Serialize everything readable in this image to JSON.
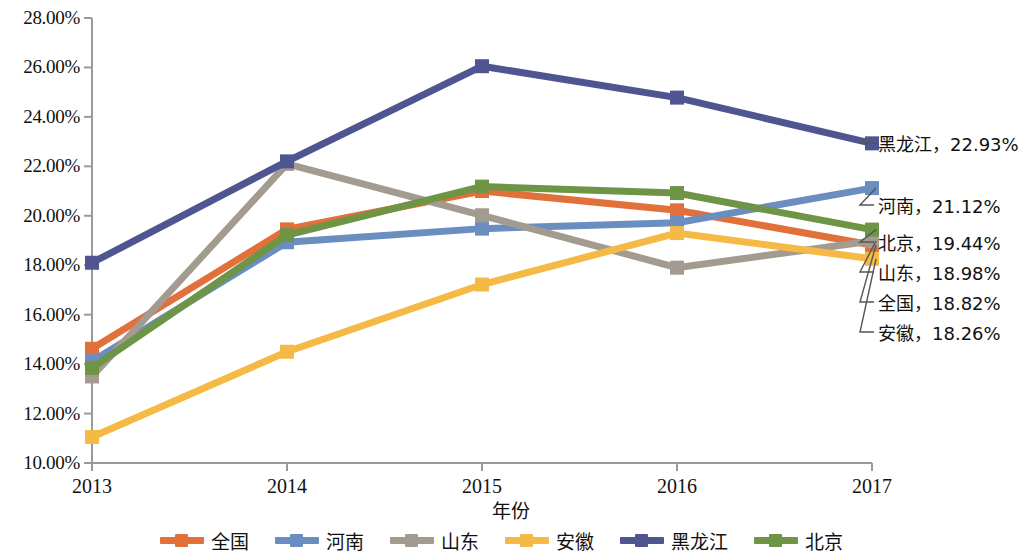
{
  "chart_data": {
    "type": "line",
    "title": "",
    "xlabel": "年份",
    "ylabel": "",
    "x": [
      "2013",
      "2014",
      "2015",
      "2016",
      "2017"
    ],
    "categories": [
      "2013",
      "2014",
      "2015",
      "2016",
      "2017"
    ],
    "ylim": [
      10,
      28
    ],
    "ytick_labels": [
      "10.00%",
      "12.00%",
      "14.00%",
      "16.00%",
      "18.00%",
      "20.00%",
      "22.00%",
      "24.00%",
      "26.00%",
      "28.00%"
    ],
    "ytick_values": [
      10,
      12,
      14,
      16,
      18,
      20,
      22,
      24,
      26,
      28
    ],
    "grid": false,
    "legend_position": "bottom",
    "series": [
      {
        "name": "全国",
        "color": "#E2703A",
        "values": [
          14.62,
          19.45,
          21.0,
          20.22,
          18.82
        ]
      },
      {
        "name": "河南",
        "color": "#6A8EBF",
        "values": [
          14.12,
          18.93,
          19.48,
          19.72,
          21.12
        ]
      },
      {
        "name": "山东",
        "color": "#A39A90",
        "values": [
          13.5,
          22.1,
          20.02,
          17.9,
          18.98
        ]
      },
      {
        "name": "安徽",
        "color": "#F5B945",
        "values": [
          11.05,
          14.5,
          17.22,
          19.3,
          18.26
        ]
      },
      {
        "name": "黑龙江",
        "color": "#4F5590",
        "values": [
          18.1,
          22.2,
          26.05,
          24.78,
          22.93
        ]
      },
      {
        "name": "北京",
        "color": "#6E9445",
        "values": [
          13.85,
          19.22,
          21.18,
          20.92,
          19.44
        ]
      }
    ],
    "end_labels": [
      {
        "name": "黑龙江",
        "value": "22.93%",
        "text": "黑龙江，22.93%",
        "color": "#4F5590"
      },
      {
        "name": "河南",
        "value": "21.12%",
        "text": "河南，21.12%",
        "color": "#6A8EBF"
      },
      {
        "name": "北京",
        "value": "19.44%",
        "text": "北京，19.44%",
        "color": "#6E9445"
      },
      {
        "name": "山东",
        "value": "18.98%",
        "text": "山东，18.98%",
        "color": "#A39A90"
      },
      {
        "name": "全国",
        "value": "18.82%",
        "text": "全国，18.82%",
        "color": "#E2703A"
      },
      {
        "name": "安徽",
        "value": "18.26%",
        "text": "安徽，18.26%",
        "color": "#F5B945"
      }
    ],
    "legend": [
      "全国",
      "河南",
      "山东",
      "安徽",
      "黑龙江",
      "北京"
    ]
  },
  "axis": {
    "x_title": "年份",
    "y_ticks": [
      "28.00%",
      "26.00%",
      "24.00%",
      "22.00%",
      "20.00%",
      "18.00%",
      "16.00%",
      "14.00%",
      "12.00%",
      "10.00%"
    ],
    "x_ticks": [
      "2013",
      "2014",
      "2015",
      "2016",
      "2017"
    ],
    "axis_color": "#9a9a9a"
  }
}
